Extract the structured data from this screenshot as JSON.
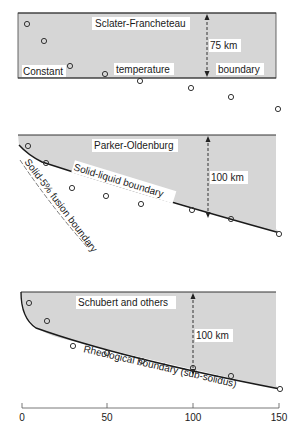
{
  "panels": [
    {
      "title": "Sclater-Francheteau",
      "thickness_label": "75 km",
      "boundary_words": [
        "Constant",
        "temperature",
        "boundary"
      ],
      "boundary_label": "Constant temperature boundary"
    },
    {
      "title": "Parker-Oldenburg",
      "thickness_label": "100 km",
      "boundary_label": "Solid-liquid boundary",
      "secondary_boundary_label": "Solid-5% fusion boundary"
    },
    {
      "title": "Schubert and others",
      "thickness_label": "100 km",
      "boundary_label": "Rheological boundary (sub-solidus)"
    }
  ],
  "axis": {
    "ticks": [
      "0",
      "50",
      "100",
      "150"
    ]
  },
  "colors": {
    "fill": "#d6d6d6",
    "line": "#1a1a1a",
    "point": "#333333"
  }
}
